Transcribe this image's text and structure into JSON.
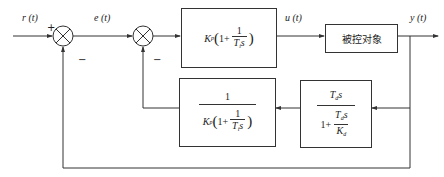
{
  "diagram": {
    "type": "control-system-block-diagram",
    "signals": {
      "input": "r (t)",
      "error": "e (t)",
      "control": "u (t)",
      "output": "y (t)"
    },
    "junctions": [
      {
        "id": "sum1",
        "plus_sign": "+",
        "minus_sign": "−"
      },
      {
        "id": "sum2",
        "minus_sign": "−"
      }
    ],
    "blocks": {
      "pi_controller": {
        "gain": "K",
        "gain_sub": "p",
        "one_plus": "1+",
        "num": "1",
        "den_T": "T",
        "den_T_sub": "i",
        "den_s": "s",
        "open_paren": "(",
        "close_paren": ")"
      },
      "plant": {
        "label": "被控对象"
      },
      "inverse_pi": {
        "num": "1",
        "gain": "K",
        "gain_sub": "p",
        "one_plus": "1+",
        "inner_num": "1",
        "den_T": "T",
        "den_T_sub": "i",
        "den_s": "s",
        "open_paren": "(",
        "close_paren": ")"
      },
      "derivative": {
        "num_T": "T",
        "num_T_sub": "d",
        "num_s": "s",
        "one_plus": "1+",
        "inner_num_T": "T",
        "inner_num_T_sub": "d",
        "inner_num_s": "s",
        "inner_den_K": "K",
        "inner_den_K_sub": "d"
      }
    },
    "colors": {
      "line": "#333333",
      "background": "#ffffff"
    }
  }
}
